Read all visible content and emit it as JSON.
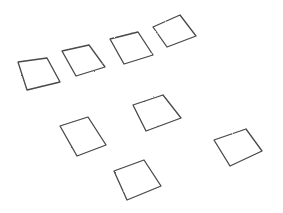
{
  "scene": {
    "background": "#ffffff",
    "stroke_color": "#4a4a4a",
    "fill_color": "#ffffff",
    "tiles": [
      {
        "id": "tile-1",
        "points": "18,62 47,58 60,82 27,90"
      },
      {
        "id": "tile-2",
        "points": "62,51 89,45 105,67 76,76"
      },
      {
        "id": "tile-3",
        "points": "110,39 138,32 153,55 124,64"
      },
      {
        "id": "tile-4",
        "points": "153,27 180,15 196,36 167,47"
      },
      {
        "id": "tile-5",
        "points": "60,126 88,117 106,145 77,156"
      },
      {
        "id": "tile-6",
        "points": "133,105 163,95 181,118 146,131"
      },
      {
        "id": "tile-7",
        "points": "114,171 144,160 161,186 127,200"
      },
      {
        "id": "tile-8",
        "points": "214,140 246,129 262,151 230,166"
      }
    ]
  }
}
